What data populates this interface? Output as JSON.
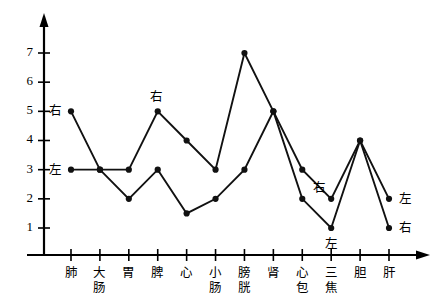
{
  "chart_data": {
    "type": "line",
    "title": "",
    "subtitle": "",
    "xlabel": "",
    "ylabel": "",
    "categories": [
      "肺",
      "大肠",
      "胃",
      "脾",
      "心",
      "小肠",
      "膀胱",
      "肾",
      "心包",
      "三焦",
      "胆",
      "肝"
    ],
    "series": [
      {
        "name": "右",
        "values": [
          5,
          3,
          3,
          5,
          4,
          3,
          7,
          5,
          3,
          2,
          4,
          1
        ]
      },
      {
        "name": "左",
        "values": [
          3,
          3,
          2,
          3,
          1.5,
          2,
          3,
          5,
          2,
          1,
          4,
          2
        ]
      }
    ],
    "ylim": [
      0,
      8
    ],
    "y_ticks": [
      1,
      2,
      3,
      4,
      5,
      6,
      7
    ],
    "y_tick_labels": [
      "1",
      "2",
      "3",
      "4",
      "5",
      "6",
      "7"
    ],
    "grid": false,
    "legend": "none",
    "marker": "filled-circle",
    "annotations": [
      {
        "label": "右",
        "series": "右",
        "category": "肺",
        "value": 5,
        "position": "left"
      },
      {
        "label": "左",
        "series": "左",
        "category": "肺",
        "value": 3,
        "position": "left"
      },
      {
        "label": "右",
        "series": "右",
        "category": "脾",
        "value": 5,
        "position": "above"
      },
      {
        "label": "右",
        "series": "右",
        "category": "三焦",
        "value": 2,
        "position": "above-left"
      },
      {
        "label": "左",
        "series": "左",
        "category": "三焦",
        "value": 1,
        "position": "below"
      },
      {
        "label": "左",
        "series": "左",
        "category": "肝",
        "value": 2,
        "position": "right"
      },
      {
        "label": "右",
        "series": "右",
        "category": "肝",
        "value": 1,
        "position": "right"
      }
    ],
    "colors": {
      "axis": "#000000",
      "series_right": "#111111",
      "series_left": "#111111",
      "background": "#ffffff"
    }
  }
}
